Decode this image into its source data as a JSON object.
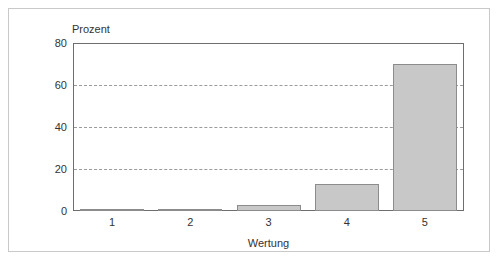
{
  "chart_data": {
    "type": "bar",
    "title": "",
    "subtitle": "",
    "xlabel": "Wertung",
    "ylabel": "Prozent",
    "categories": [
      "1",
      "2",
      "3",
      "4",
      "5"
    ],
    "values": [
      0,
      1,
      3,
      13,
      70
    ],
    "ylim": [
      0,
      80
    ],
    "yticks": [
      0,
      20,
      40,
      60,
      80
    ],
    "ytick_labels": [
      "0",
      "20",
      "40",
      "60",
      "80"
    ],
    "grid": true,
    "gridlines_at": [
      20,
      40,
      60
    ],
    "legend": null,
    "legend_position": "none",
    "series": [
      {
        "name": "Prozent",
        "values": [
          0,
          1,
          3,
          13,
          70
        ]
      }
    ],
    "annotations": []
  },
  "style": {
    "bar_fill": "#c8c8c8",
    "bar_border": "#8c8c8c",
    "axis_color": "#6e6e6e",
    "grid_color": "#9b9b9b",
    "frame_color": "#c9c9c9",
    "text_color": "#333333",
    "background": "#ffffff"
  }
}
